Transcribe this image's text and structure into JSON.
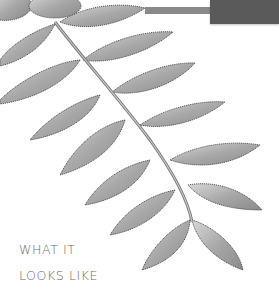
{
  "image": {
    "subject": "compound pinnate leaf illustration (grayscale)",
    "colors": {
      "header_bar": "#8a8a8a",
      "header_box": "#5a5a5a",
      "caption": "#6a6a6a",
      "leaf_fill": "#b8b8b8",
      "leaf_edge": "#3a3a3a"
    }
  },
  "caption": {
    "line1": "WHAT IT",
    "line2": "LOOKS LIKE"
  }
}
